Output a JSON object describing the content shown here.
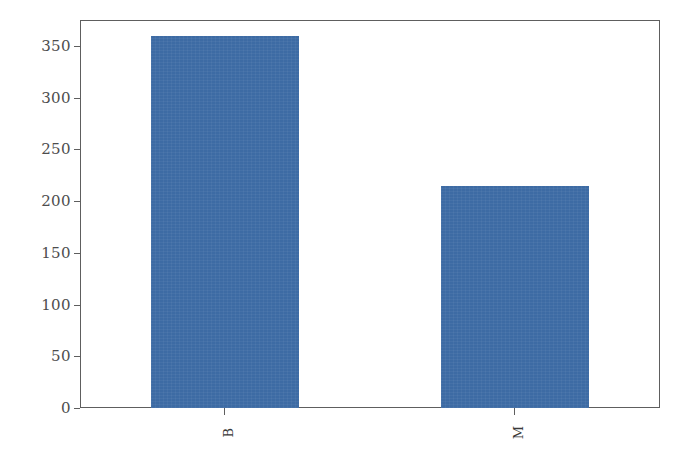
{
  "chart_data": {
    "type": "bar",
    "title": "",
    "subtitle": "",
    "xlabel": "",
    "ylabel": "",
    "categories": [
      "B",
      "M"
    ],
    "values": [
      360,
      215
    ],
    "series": [
      {
        "name": "count",
        "values": [
          360,
          215
        ],
        "color": "#3d6ba4"
      }
    ],
    "ylim": [
      0,
      375
    ],
    "yticks": [
      0,
      50,
      100,
      150,
      200,
      250,
      300,
      350
    ],
    "ytick_labels": [
      "0",
      "50",
      "100",
      "150",
      "200",
      "250",
      "300",
      "350"
    ],
    "xtick_labels": [
      "B",
      "M"
    ],
    "grid": false,
    "legend": null,
    "legend_position": "none",
    "annotations": [],
    "bar_color": "#3d6ba4",
    "axis_color": "#5e5e5e",
    "tick_label_color": "#4d4d4d",
    "background_color": "#ffffff",
    "xtick_label_rotation": 90
  }
}
